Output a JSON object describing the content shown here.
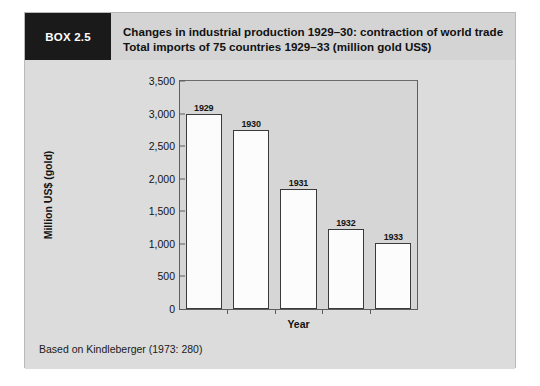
{
  "box": {
    "tag": "BOX 2.5",
    "title": "Changes in industrial production 1929–30: contraction of world trade Total imports of 75 countries 1929–33 (million gold US$)",
    "source_note": "Based on Kindleberger (1973: 280)"
  },
  "chart_data": {
    "type": "bar",
    "title": "",
    "categories": [
      "1929",
      "1930",
      "1931",
      "1932",
      "1933"
    ],
    "values": [
      3000,
      2750,
      1850,
      1225,
      1010
    ],
    "data_labels": [
      "1929",
      "1930",
      "1931",
      "1932",
      "1933"
    ],
    "xlabel": "Year",
    "ylabel": "Million US$ (gold)",
    "ylim": [
      0,
      3500
    ],
    "ytick_step": 500,
    "ytick_labels": [
      "0",
      "500",
      "1,000",
      "1,500",
      "2,000",
      "2,500",
      "3,000",
      "3,500"
    ],
    "ytick_values": [
      0,
      500,
      1000,
      1500,
      2000,
      2500,
      3000,
      3500
    ],
    "grid": false,
    "legend": null,
    "bar_fill": "#fcfcfc",
    "bar_edge": "#3a3a3a",
    "plot_background": "#d6d6d6"
  }
}
